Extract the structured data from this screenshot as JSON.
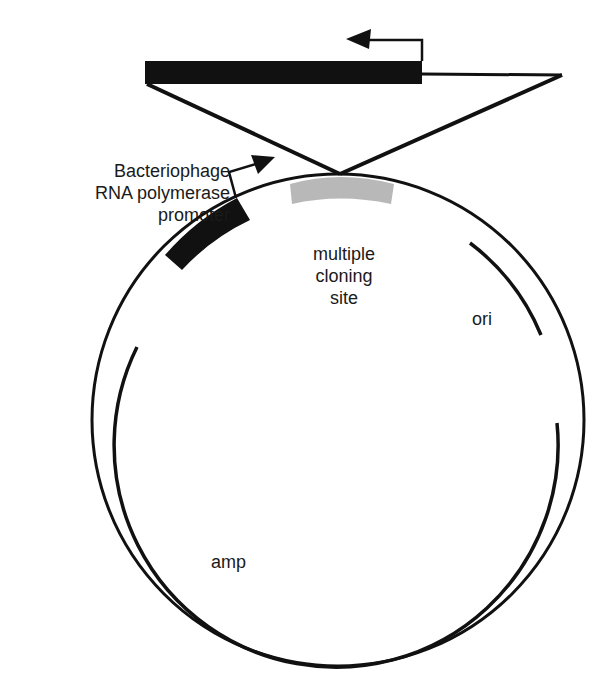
{
  "diagram": {
    "type": "plasmid map",
    "labels": {
      "promoter": [
        "Bacteriophage",
        "RNA polymerase",
        "promoter"
      ],
      "mcs": [
        "multiple",
        "cloning",
        "site"
      ],
      "ori": "ori",
      "amp": "amp"
    },
    "colors": {
      "stroke": "#111111",
      "mcs_fill": "#b8b8b8",
      "background": "#ffffff"
    }
  }
}
